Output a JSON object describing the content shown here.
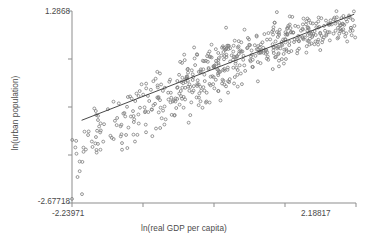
{
  "chart_data": {
    "type": "scatter",
    "title": "",
    "xlabel": "ln(real GDP per capita)",
    "ylabel": "ln(urban population)",
    "xlim": [
      -2.23971,
      2.18817
    ],
    "ylim": [
      -2.67718,
      1.2868
    ],
    "xticks": [
      -2.23971,
      -1.13274,
      -0.02577,
      1.0812,
      2.18817
    ],
    "yticks": [
      -2.67718,
      -1.68619,
      -0.6952,
      0.29579,
      1.2868
    ],
    "xtick_labels_shown": [
      "-2.23971",
      "2.18817"
    ],
    "ytick_labels_shown": [
      "-2.67718",
      "1.2868"
    ],
    "grid": false,
    "legend": false,
    "marker": "open-circle",
    "marker_color": "#7d7d7d",
    "fit_line": {
      "type": "linear",
      "color": "#333333",
      "x_start": -2.09,
      "y_start": -0.97,
      "x_end": 2.16,
      "y_end": 1.22
    },
    "n_points": 560,
    "series": [
      {
        "name": "countries",
        "points": [
          [
            -2.17,
            -1.66
          ],
          [
            -2.06,
            -1.62
          ],
          [
            -2.12,
            -2.02
          ],
          [
            -1.98,
            -1.2
          ],
          [
            -1.92,
            -1.52
          ],
          [
            -1.86,
            -0.86
          ],
          [
            -1.79,
            -1.18
          ],
          [
            -1.74,
            -1.05
          ],
          [
            -1.68,
            -0.74
          ],
          [
            -1.62,
            -1.33
          ],
          [
            -1.57,
            -0.98
          ],
          [
            -1.51,
            -0.62
          ],
          [
            -1.46,
            -1.44
          ],
          [
            -1.41,
            -0.89
          ],
          [
            -1.36,
            -1.12
          ],
          [
            -1.31,
            -0.52
          ],
          [
            -1.27,
            -0.95
          ],
          [
            -1.22,
            -1.27
          ],
          [
            -1.18,
            -0.71
          ],
          [
            -1.13,
            -0.44
          ],
          [
            -1.09,
            -1.06
          ],
          [
            -1.05,
            -0.8
          ],
          [
            -1.01,
            -0.34
          ],
          [
            -0.97,
            -0.66
          ],
          [
            -0.93,
            -1.14
          ],
          [
            -0.89,
            -0.49
          ],
          [
            -0.85,
            -0.23
          ],
          [
            -0.82,
            -0.77
          ],
          [
            -0.78,
            -0.95
          ],
          [
            -0.74,
            -0.4
          ],
          [
            -0.71,
            -0.13
          ],
          [
            -0.67,
            -0.58
          ],
          [
            -0.64,
            -0.86
          ],
          [
            -0.6,
            -0.3
          ],
          [
            -0.57,
            -0.03
          ],
          [
            -0.54,
            -0.47
          ],
          [
            -0.5,
            -0.71
          ],
          [
            -0.47,
            -0.18
          ],
          [
            -0.44,
            0.08
          ],
          [
            -0.41,
            -0.36
          ],
          [
            -0.38,
            -0.6
          ],
          [
            -0.35,
            -0.08
          ],
          [
            -0.32,
            0.17
          ],
          [
            -0.29,
            -0.26
          ],
          [
            -0.26,
            -0.5
          ],
          [
            -0.23,
            0.02
          ],
          [
            -0.2,
            0.26
          ],
          [
            -0.17,
            -0.16
          ],
          [
            -0.14,
            -0.4
          ],
          [
            -0.11,
            0.11
          ],
          [
            -0.08,
            0.34
          ],
          [
            -0.05,
            -0.06
          ],
          [
            -0.02,
            -0.31
          ],
          [
            0.01,
            0.2
          ],
          [
            0.04,
            0.42
          ],
          [
            0.07,
            0.03
          ],
          [
            0.1,
            -0.21
          ],
          [
            0.13,
            0.29
          ],
          [
            0.16,
            0.5
          ],
          [
            0.19,
            0.12
          ],
          [
            0.22,
            -0.12
          ],
          [
            0.25,
            0.37
          ],
          [
            0.28,
            0.57
          ],
          [
            0.31,
            0.2
          ],
          [
            0.34,
            -0.03
          ],
          [
            0.37,
            0.45
          ],
          [
            0.4,
            0.64
          ],
          [
            0.43,
            0.28
          ],
          [
            0.46,
            0.05
          ],
          [
            0.49,
            0.52
          ],
          [
            0.52,
            0.7
          ],
          [
            0.55,
            0.35
          ],
          [
            0.58,
            0.13
          ],
          [
            0.61,
            0.58
          ],
          [
            0.64,
            0.76
          ],
          [
            0.67,
            0.42
          ],
          [
            0.7,
            0.21
          ],
          [
            0.73,
            0.64
          ],
          [
            0.76,
            0.81
          ],
          [
            0.79,
            0.48
          ],
          [
            0.82,
            0.28
          ],
          [
            0.85,
            0.7
          ],
          [
            0.88,
            0.86
          ],
          [
            0.91,
            0.54
          ],
          [
            0.94,
            0.34
          ],
          [
            0.97,
            0.75
          ],
          [
            1.0,
            0.9
          ],
          [
            1.03,
            0.6
          ],
          [
            1.06,
            0.4
          ],
          [
            1.09,
            0.8
          ],
          [
            1.12,
            0.94
          ],
          [
            1.15,
            0.65
          ],
          [
            1.18,
            0.46
          ],
          [
            1.21,
            0.84
          ],
          [
            1.24,
            0.98
          ],
          [
            1.27,
            0.7
          ],
          [
            1.3,
            0.51
          ],
          [
            1.33,
            0.88
          ],
          [
            1.36,
            1.01
          ],
          [
            1.39,
            0.74
          ],
          [
            1.42,
            0.56
          ],
          [
            1.45,
            0.92
          ],
          [
            1.48,
            1.04
          ],
          [
            1.51,
            0.78
          ],
          [
            1.54,
            0.6
          ],
          [
            1.57,
            0.95
          ],
          [
            1.6,
            1.07
          ],
          [
            1.63,
            0.82
          ],
          [
            1.66,
            0.64
          ],
          [
            1.69,
            0.98
          ],
          [
            1.72,
            1.09
          ],
          [
            1.75,
            0.85
          ],
          [
            1.78,
            0.68
          ],
          [
            1.81,
            1.01
          ],
          [
            1.84,
            1.12
          ],
          [
            1.87,
            0.88
          ],
          [
            1.9,
            0.72
          ],
          [
            1.93,
            1.04
          ],
          [
            1.96,
            1.14
          ],
          [
            1.99,
            0.91
          ],
          [
            2.02,
            0.76
          ],
          [
            2.05,
            1.07
          ],
          [
            2.08,
            1.16
          ],
          [
            2.11,
            0.94
          ],
          [
            2.14,
            1.1
          ]
        ]
      }
    ]
  }
}
